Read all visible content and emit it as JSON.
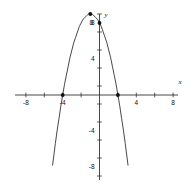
{
  "chart_data": {
    "type": "line",
    "title": "",
    "subtitle": "",
    "xlabel": "x",
    "ylabel": "y",
    "xlim": [
      -9.5,
      9.5
    ],
    "ylim": [
      -11,
      11
    ],
    "grid": false,
    "legend": null,
    "x_ticks": [
      -8,
      -4,
      4,
      8
    ],
    "x_tick_labels": [
      "-8",
      "-4",
      "4",
      "8"
    ],
    "y_ticks": [
      -8,
      -4,
      4,
      8
    ],
    "y_tick_labels": [
      "-8",
      "-4",
      "4",
      "8"
    ],
    "minor_tick_step": 2,
    "curve": {
      "name": "parabola",
      "equation_form": "y = a(x - h)^2 + k",
      "opens": "down",
      "a": -1,
      "vertex": [
        -1,
        9
      ],
      "x_intercepts": [
        -4,
        2
      ],
      "y_intercept": 8,
      "color": "#333333",
      "x": [
        -5.1,
        -5.0,
        -4.8,
        -4.6,
        -4.4,
        -4.2,
        -4.0,
        -3.8,
        -3.6,
        -3.4,
        -3.2,
        -3.0,
        -2.8,
        -2.6,
        -2.4,
        -2.2,
        -2.0,
        -1.8,
        -1.6,
        -1.4,
        -1.2,
        -1.0,
        -0.8,
        -0.6,
        -0.4,
        -0.2,
        0.0,
        0.2,
        0.4,
        0.6,
        0.8,
        1.0,
        1.2,
        1.4,
        1.6,
        1.8,
        2.0,
        2.2,
        2.4,
        2.6,
        2.8,
        3.0,
        3.1
      ],
      "y": [
        -7.8,
        -7.0,
        -5.4,
        -3.9,
        -2.6,
        -1.2,
        0.0,
        1.2,
        2.2,
        3.2,
        4.2,
        5.0,
        5.8,
        6.4,
        7.0,
        7.6,
        8.0,
        8.4,
        8.6,
        8.8,
        9.0,
        9.0,
        9.0,
        8.8,
        8.6,
        8.4,
        8.0,
        7.6,
        7.0,
        6.4,
        5.8,
        5.0,
        4.2,
        3.2,
        2.2,
        1.2,
        0.0,
        -1.2,
        -2.6,
        -3.9,
        -5.4,
        -7.0,
        -7.8
      ]
    },
    "points": [
      {
        "name": "vertex-point",
        "x": -1,
        "y": 9,
        "label": ""
      },
      {
        "name": "y-intercept-point",
        "x": 0,
        "y": 8,
        "label": "8"
      },
      {
        "name": "left-x-intercept-point",
        "x": -4,
        "y": 0,
        "label": ""
      },
      {
        "name": "right-x-intercept-point",
        "x": 2,
        "y": 0,
        "label": ""
      }
    ],
    "point_labels": [
      {
        "name": "y-intercept-label",
        "text": "8",
        "x": -0.7,
        "y": 8.0
      }
    ]
  }
}
